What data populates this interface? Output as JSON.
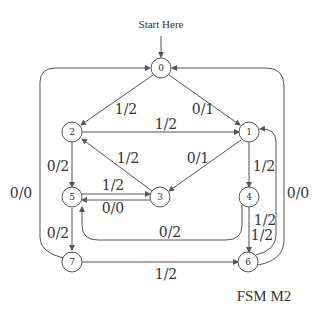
{
  "diagram": {
    "start_label": "Start Here",
    "caption": "FSM M2",
    "colors": {
      "stroke": "#555555",
      "text": "#333333",
      "background": "#ffffff"
    },
    "states": [
      {
        "id": "0",
        "label": "0"
      },
      {
        "id": "1",
        "label": "1"
      },
      {
        "id": "2",
        "label": "2"
      },
      {
        "id": "3",
        "label": "3"
      },
      {
        "id": "4",
        "label": "4"
      },
      {
        "id": "5",
        "label": "5"
      },
      {
        "id": "6",
        "label": "6"
      },
      {
        "id": "7",
        "label": "7"
      }
    ],
    "transitions": [
      {
        "from": "0",
        "to": "2",
        "label": "1/2"
      },
      {
        "from": "0",
        "to": "1",
        "label": "0/1"
      },
      {
        "from": "2",
        "to": "1",
        "label": "1/2"
      },
      {
        "from": "2",
        "to": "5",
        "label": "0/2"
      },
      {
        "from": "3",
        "to": "2",
        "label": "1/2"
      },
      {
        "from": "1",
        "to": "3",
        "label": "0/1"
      },
      {
        "from": "1",
        "to": "4",
        "label": "1/2"
      },
      {
        "from": "5",
        "to": "3",
        "label": "1/2"
      },
      {
        "from": "3",
        "to": "5",
        "label": "0/0"
      },
      {
        "from": "4",
        "to": "6",
        "label": "1/2"
      },
      {
        "from": "6",
        "to": "1",
        "label": "1/2"
      },
      {
        "from": "4",
        "to": "5",
        "label": "0/2"
      },
      {
        "from": "5",
        "to": "7",
        "label": "0/2"
      },
      {
        "from": "7",
        "to": "6",
        "label": "1/2"
      },
      {
        "from": "7",
        "to": "0",
        "label": "0/0"
      },
      {
        "from": "6",
        "to": "0",
        "label": "0/0"
      }
    ]
  }
}
